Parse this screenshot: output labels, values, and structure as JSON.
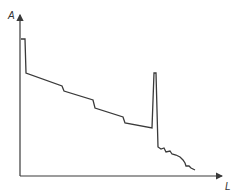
{
  "chart_data": {
    "type": "line",
    "title": "",
    "xlabel": "L",
    "ylabel": "A",
    "grid": false,
    "legend": null,
    "ticks": {
      "x": [],
      "y": []
    },
    "series": [
      {
        "name": "A vs L",
        "description": "Step-wise declining profile with a sharp narrow spike near the end, followed by a jagged decay",
        "points_px": [
          [
            21,
            39
          ],
          [
            25,
            39
          ],
          [
            26,
            73
          ],
          [
            62,
            86
          ],
          [
            64,
            91
          ],
          [
            93,
            100
          ],
          [
            95,
            108
          ],
          [
            123,
            117
          ],
          [
            125,
            123
          ],
          [
            152,
            128
          ],
          [
            154,
            73
          ],
          [
            156,
            73
          ],
          [
            158,
            147
          ],
          [
            161,
            149
          ],
          [
            164,
            148
          ],
          [
            166,
            152
          ],
          [
            170,
            151
          ],
          [
            172,
            154
          ],
          [
            176,
            155
          ],
          [
            180,
            157
          ],
          [
            183,
            160
          ],
          [
            185,
            163
          ],
          [
            186,
            166
          ],
          [
            189,
            166
          ],
          [
            191,
            168
          ],
          [
            195,
            170
          ]
        ],
        "x_relative": [
          0.0,
          0.02,
          0.03,
          0.21,
          0.22,
          0.36,
          0.37,
          0.51,
          0.52,
          0.65,
          0.66,
          0.67,
          0.68,
          0.7,
          0.71,
          0.72,
          0.74,
          0.75,
          0.77,
          0.79,
          0.8,
          0.81,
          0.82,
          0.83,
          0.84,
          0.86
        ],
        "y_relative": [
          0.86,
          0.86,
          0.64,
          0.56,
          0.53,
          0.48,
          0.43,
          0.37,
          0.33,
          0.3,
          0.64,
          0.64,
          0.18,
          0.17,
          0.18,
          0.15,
          0.16,
          0.14,
          0.13,
          0.12,
          0.1,
          0.08,
          0.06,
          0.06,
          0.05,
          0.04
        ]
      }
    ],
    "axes": {
      "origin_px": [
        20,
        176
      ],
      "x_end_px": [
        222,
        176
      ],
      "y_end_px": [
        20,
        16
      ]
    }
  },
  "labels": {
    "y_axis": "A",
    "x_axis": "L"
  },
  "colors": {
    "line": "#3a3a3a",
    "axis": "#3a3a3a",
    "background": "#ffffff"
  }
}
